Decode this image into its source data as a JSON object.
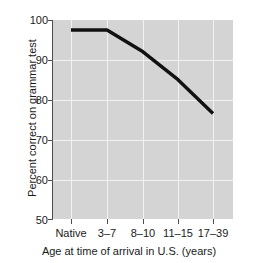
{
  "chart_data": {
    "type": "line",
    "title": "",
    "subtitle": "",
    "xlabel": "Age at time of arrival in U.S. (years)",
    "ylabel": "Percent correct on grammar test",
    "categories": [
      "Native",
      "3–7",
      "8–10",
      "11–15",
      "17–39"
    ],
    "values": [
      97.5,
      97.5,
      92.0,
      85.0,
      76.5
    ],
    "series": [
      {
        "name": "Percent correct on grammar test",
        "values": [
          97.5,
          97.5,
          92.0,
          85.0,
          76.5
        ]
      }
    ],
    "ylim": [
      50,
      100
    ],
    "yticks": [
      50,
      60,
      70,
      80,
      90,
      100
    ],
    "ytick_labels": [
      "50",
      "60",
      "70",
      "80",
      "90",
      "100"
    ],
    "grid": "both",
    "legend": "none",
    "line_color": "#111111",
    "plot_background": "#d4d4d4",
    "grid_color": "#f2f2f2",
    "axis_color": "#4d4d4d",
    "page_background": "#ffffff"
  },
  "axes": {
    "y_title": "Percent correct on grammar test",
    "x_title": "Age at time of arrival in U.S. (years)",
    "y_labels": {
      "t0": "50",
      "t1": "60",
      "t2": "70",
      "t3": "80",
      "t4": "90",
      "t5": "100"
    },
    "x_labels": {
      "c0": "Native",
      "c1": "3–7",
      "c2": "8–10",
      "c3": "11–15",
      "c4": "17–39"
    }
  }
}
